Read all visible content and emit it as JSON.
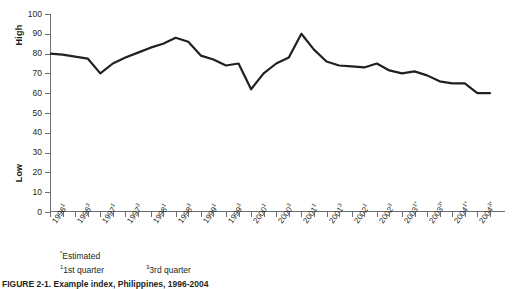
{
  "chart_data": {
    "type": "line",
    "title": "",
    "xlabel": "",
    "ylabel": "",
    "ylim": [
      0,
      100
    ],
    "ytick_values": [
      0,
      10,
      20,
      30,
      40,
      50,
      60,
      70,
      80,
      90,
      100
    ],
    "y_axis_high_label": "High",
    "y_axis_low_label": "Low",
    "grid": false,
    "legend": "none",
    "categories": [
      "1996¹",
      "",
      "1996³",
      "",
      "1997¹",
      "",
      "1997³",
      "",
      "1998¹",
      "",
      "1998³",
      "",
      "1999¹",
      "",
      "1999³",
      "",
      "2000¹",
      "",
      "2000³",
      "",
      "2001¹",
      "",
      "2001³",
      "",
      "2002¹",
      "",
      "2002³",
      "",
      "2003¹*",
      "",
      "2003³*",
      "",
      "2004¹*",
      "",
      "2004³*",
      ""
    ],
    "tick_labels": [
      {
        "index": 0,
        "text": "1996",
        "sup": "1",
        "star": false
      },
      {
        "index": 2,
        "text": "1996",
        "sup": "3",
        "star": false
      },
      {
        "index": 4,
        "text": "1997",
        "sup": "1",
        "star": false
      },
      {
        "index": 6,
        "text": "1997",
        "sup": "3",
        "star": false
      },
      {
        "index": 8,
        "text": "1998",
        "sup": "1",
        "star": false
      },
      {
        "index": 10,
        "text": "1998",
        "sup": "3",
        "star": false
      },
      {
        "index": 12,
        "text": "1999",
        "sup": "1",
        "star": false
      },
      {
        "index": 14,
        "text": "1999",
        "sup": "3",
        "star": false
      },
      {
        "index": 16,
        "text": "2000",
        "sup": "1",
        "star": false
      },
      {
        "index": 18,
        "text": "2000",
        "sup": "3",
        "star": false
      },
      {
        "index": 20,
        "text": "2001",
        "sup": "1",
        "star": false
      },
      {
        "index": 22,
        "text": "2001",
        "sup": "3",
        "star": false
      },
      {
        "index": 24,
        "text": "2002",
        "sup": "1",
        "star": false
      },
      {
        "index": 26,
        "text": "2002",
        "sup": "3",
        "star": false
      },
      {
        "index": 28,
        "text": "2003",
        "sup": "1",
        "star": true
      },
      {
        "index": 30,
        "text": "2003",
        "sup": "3",
        "star": true
      },
      {
        "index": 32,
        "text": "2004",
        "sup": "1",
        "star": true
      },
      {
        "index": 34,
        "text": "2004",
        "sup": "3",
        "star": true
      }
    ],
    "n_ticks": 36,
    "values": [
      80,
      79.5,
      78.5,
      77.5,
      70,
      75,
      78,
      80.5,
      83,
      85,
      88,
      86,
      79,
      77,
      74,
      75,
      62,
      70,
      75,
      78,
      90,
      82,
      76,
      74,
      73.5,
      73,
      75,
      71.5,
      70,
      71,
      69,
      66,
      65,
      65,
      60,
      60
    ],
    "series_color": "#231f20",
    "axis_color": "#6d6e71"
  },
  "footnotes": {
    "estimated_mark": "*",
    "estimated": "Estimated",
    "q1_mark": "1",
    "q1": "1st quarter",
    "q3_mark": "3",
    "q3": "3rd quarter"
  },
  "caption": "FIGURE 2-1. Example index, Philippines, 1996-2004"
}
